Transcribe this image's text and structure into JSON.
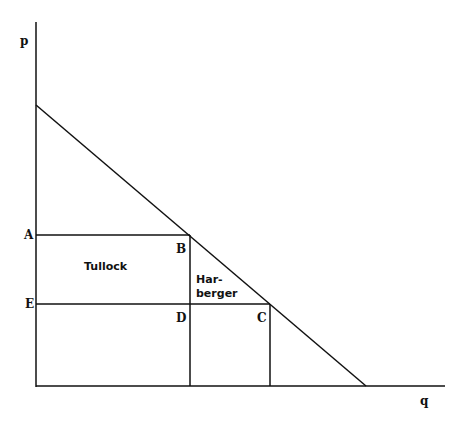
{
  "axes": {
    "y_label": "p",
    "x_label": "q"
  },
  "points": {
    "A": "A",
    "B": "B",
    "C": "C",
    "D": "D",
    "E": "E"
  },
  "regions": {
    "tullock": "Tullock",
    "harberger_1": "Har-",
    "harberger_2": "berger"
  },
  "colors": {
    "line": "#111111",
    "background": "#ffffff"
  }
}
